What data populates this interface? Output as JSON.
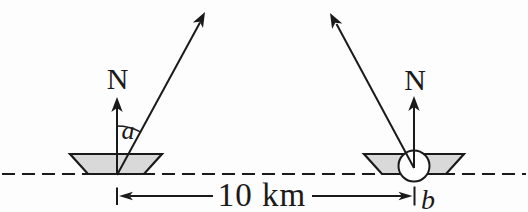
{
  "figure": {
    "left_vessel": {
      "north_label": "N",
      "angle_label": "a"
    },
    "right_vessel": {
      "north_label": "N",
      "angle_label": "b"
    },
    "distance_label": "10 km",
    "colors": {
      "ink": "#1a1a1a",
      "hull_fill": "#d9d9d9",
      "marker_circle_fill": "#ffffff",
      "background": "#fdfdfd"
    }
  }
}
